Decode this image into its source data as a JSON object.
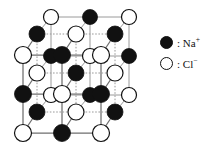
{
  "figure": {
    "projection": "oblique",
    "grid_size": 3
  },
  "legend": {
    "items": [
      {
        "marker": "filled-circle",
        "separator": ":",
        "label": "Na",
        "charge": "+",
        "color": "#111111"
      },
      {
        "marker": "open-circle",
        "separator": ":",
        "label": "Cl",
        "charge": "−",
        "color": "#ffffff"
      }
    ]
  },
  "colors": {
    "ion_na_fill": "#111111",
    "ion_cl_fill": "#ffffff",
    "ion_stroke": "#111111",
    "bond_front": "#6e6e6e",
    "bond_hidden": "#9a9a9a",
    "background": "#ffffff"
  },
  "lattice": {
    "layers": [
      {
        "name": "back-layer",
        "origin_x": 51,
        "origin_y": 17,
        "step_x": 39,
        "step_y": 0,
        "row_step_x": 0,
        "row_step_y": 39,
        "ion_radius": 7.5,
        "ions": [
          [
            "Cl",
            "Na",
            "Cl"
          ],
          [
            "Na",
            "Cl",
            "Na"
          ],
          [
            "Cl",
            "Na",
            "Cl"
          ]
        ]
      },
      {
        "name": "middle-layer",
        "origin_x": 37,
        "origin_y": 34,
        "step_x": 39,
        "step_y": 0,
        "row_step_x": 0,
        "row_step_y": 39,
        "ion_radius": 8,
        "ions": [
          [
            "Na",
            "Cl",
            "Na"
          ],
          [
            "Cl",
            "Na",
            "Cl"
          ],
          [
            "Na",
            "Cl",
            "Na"
          ]
        ]
      },
      {
        "name": "front-layer",
        "origin_x": 23,
        "origin_y": 55,
        "step_x": 39,
        "step_y": 0,
        "row_step_x": 0,
        "row_step_y": 39,
        "ion_radius": 8.5,
        "ions": [
          [
            "Cl",
            "Na",
            "Cl"
          ],
          [
            "Na",
            "Cl",
            "Na"
          ],
          [
            "Cl",
            "Na",
            "Cl"
          ]
        ]
      }
    ]
  }
}
